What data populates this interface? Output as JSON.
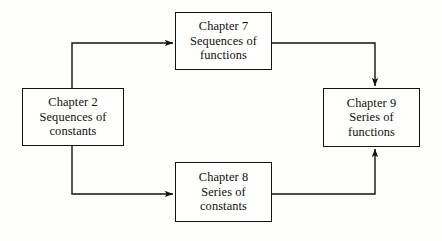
{
  "diagram": {
    "type": "flow-diagram",
    "title": "",
    "background_color": "#fefefd",
    "line_color": "#14110f",
    "text_color": "#100e0c",
    "nodes": [
      {
        "id": "ch2",
        "lines": [
          "Chapter 2",
          "Sequences of",
          "constants"
        ],
        "line1": "Chapter 2",
        "line2": "Sequences of",
        "line3": "constants"
      },
      {
        "id": "ch7",
        "lines": [
          "Chapter 7",
          "Sequences of",
          "functions"
        ],
        "line1": "Chapter 7",
        "line2": "Sequences of",
        "line3": "functions"
      },
      {
        "id": "ch8",
        "lines": [
          "Chapter 8",
          "Series of",
          "constants"
        ],
        "line1": "Chapter 8",
        "line2": "Series of",
        "line3": "constants"
      },
      {
        "id": "ch9",
        "lines": [
          "Chapter 9",
          "Series of",
          "functions"
        ],
        "line1": "Chapter 9",
        "line2": "Series of",
        "line3": "functions"
      }
    ],
    "edges": [
      {
        "id": "e1",
        "from": "ch2",
        "to": "ch7",
        "label": ""
      },
      {
        "id": "e2",
        "from": "ch7",
        "to": "ch9",
        "label": ""
      },
      {
        "id": "e3",
        "from": "ch2",
        "to": "ch8",
        "label": ""
      },
      {
        "id": "e4",
        "from": "ch8",
        "to": "ch9",
        "label": ""
      }
    ]
  }
}
